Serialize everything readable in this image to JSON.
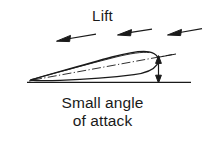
{
  "figure": {
    "title": "Lift",
    "caption_line_1": "Small angle",
    "caption_line_2": "of attack",
    "background_color": "#ffffff",
    "ink_color": "#1a1a1a"
  },
  "diagram": {
    "type": "airfoil-angle-of-attack",
    "airflow_arrows": [
      {
        "name": "airflow-arrow-left",
        "direction": "left"
      },
      {
        "name": "airflow-arrow-middle",
        "direction": "left"
      },
      {
        "name": "airflow-arrow-right",
        "direction": "left"
      }
    ],
    "airfoil": {
      "name": "airfoil-cross-section",
      "leading_edge": "right-rounded",
      "trailing_edge": "left-sharp"
    },
    "chord_line": {
      "name": "chord-line",
      "style": "dash-dot"
    },
    "reference_line": {
      "name": "horizontal-reference-line",
      "style": "solid"
    },
    "angle_indicator": {
      "name": "angle-of-attack-arrow",
      "style": "double-headed-vertical"
    }
  }
}
